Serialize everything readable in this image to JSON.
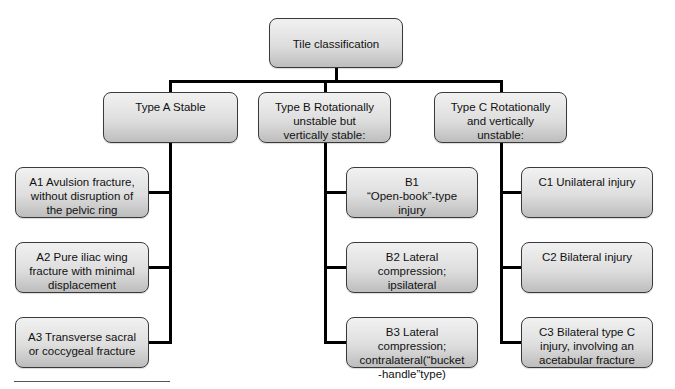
{
  "diagram": {
    "root": {
      "label": "Tile classification"
    },
    "types": [
      {
        "id": "A",
        "label": "Type A Stable",
        "children": [
          {
            "id": "A1",
            "label": "A1 Avulsion fracture,\nwithout disruption of\nthe pelvic ring"
          },
          {
            "id": "A2",
            "label": "A2 Pure iliac wing\nfracture with minimal\ndisplacement"
          },
          {
            "id": "A3",
            "label": "A3 Transverse sacral\nor coccygeal fracture"
          }
        ]
      },
      {
        "id": "B",
        "label": "Type B Rotationally\nunstable but\nvertically stable:",
        "children": [
          {
            "id": "B1",
            "label": "B1\n“Open-book”-type\ninjury"
          },
          {
            "id": "B2",
            "label": "B2 Lateral compression;\nipsilateral"
          },
          {
            "id": "B3",
            "label": "B3 Lateral compression;\ncontralateral(“bucket\n-handle”type)"
          }
        ]
      },
      {
        "id": "C",
        "label": "Type C Rotationally\nand vertically\nunstable:",
        "children": [
          {
            "id": "C1",
            "label": "C1 Unilateral injury"
          },
          {
            "id": "C2",
            "label": "C2 Bilateral injury"
          },
          {
            "id": "C3",
            "label": "C3 Bilateral type C\ninjury, involving an\nacetabular fracture"
          }
        ]
      }
    ]
  },
  "colors": {
    "box_top": "#f1f1f1",
    "box_bottom": "#bdbdbd",
    "box_border": "#3a3a3a",
    "connector": "#000000"
  }
}
